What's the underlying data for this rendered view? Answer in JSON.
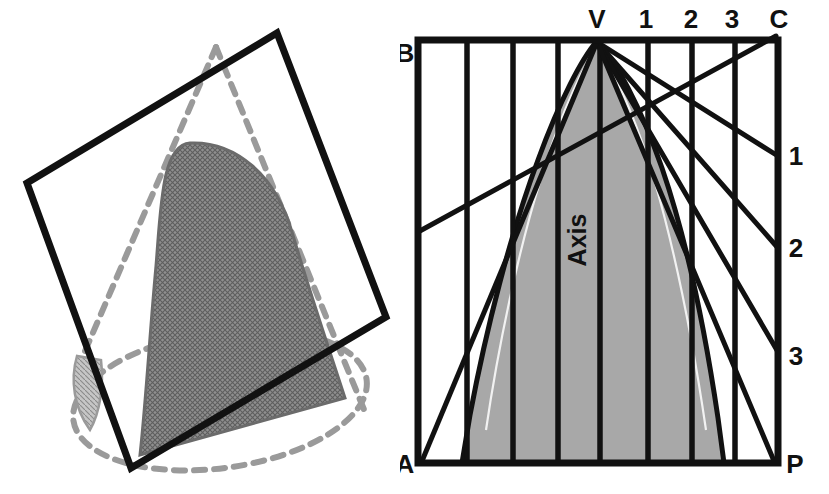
{
  "figure": {
    "panels": [
      {
        "id": "pictorial-view",
        "name": "Pictorial view of cone cut by cutting plane",
        "description": "A dashed cone in pictorial view intersected by a solid-outlined square cutting plane; the resulting parabolic section is shown hatched in grey."
      },
      {
        "id": "orthographic-view",
        "name": "Front view of cone with generator lines and cutting plane trace",
        "description": "Front view of the cone: rectangle A-B-C-P with apex V on the top edge, numbered generator points 1, 2, 3 along the top and right edges, vertical element lines, and the hatched parabolic section."
      }
    ]
  },
  "left_panel": {
    "square": {
      "name": "cutting-plane-square",
      "stroke": "#111111",
      "stroke_width": 7,
      "corners": [
        {
          "x": 27,
          "y": 183
        },
        {
          "x": 277,
          "y": 33
        },
        {
          "x": 386,
          "y": 317
        },
        {
          "x": 131,
          "y": 468
        }
      ]
    },
    "cone": {
      "name": "cone-outline-dashed",
      "stroke": "#9a9a9a",
      "stroke_width": 6,
      "dash": "11 9",
      "apex": {
        "x": 216,
        "y": 47
      },
      "base_ellipse": {
        "cx": 220,
        "cy": 400,
        "rx": 148,
        "ry": 68,
        "rotation": -8
      }
    },
    "section": {
      "name": "parabolic-section-hatched",
      "fill": "#8d8d8d",
      "stroke": "#6d6d6d",
      "stroke_width": 3,
      "hatch_color": "#5d5d5d"
    }
  },
  "right_panel": {
    "rect": {
      "name": "bounding-rectangle",
      "stroke": "#111111",
      "stroke_width": 7,
      "left": 18,
      "right": 378,
      "top": 40,
      "bottom": 463
    },
    "apex": {
      "name": "apex-V",
      "x": 197,
      "y": 40
    },
    "corner_labels": [
      {
        "id": "B",
        "text": "B",
        "x": 4,
        "y": 54,
        "name": "label-B",
        "anchor": "middle"
      },
      {
        "id": "A",
        "text": "A",
        "x": 4,
        "y": 470,
        "name": "label-A",
        "anchor": "middle"
      },
      {
        "id": "P",
        "text": "P",
        "x": 393,
        "y": 470,
        "name": "label-P",
        "anchor": "middle"
      },
      {
        "id": "C",
        "text": "C",
        "x": 378,
        "y": 26,
        "name": "label-C",
        "anchor": "middle"
      }
    ],
    "top_labels": [
      {
        "text": "V",
        "x": 197,
        "y": 26,
        "name": "label-top-V"
      },
      {
        "text": "1",
        "x": 245,
        "y": 26,
        "name": "label-top-1"
      },
      {
        "text": "2",
        "x": 290,
        "y": 26,
        "name": "label-top-2"
      },
      {
        "text": "3",
        "x": 331,
        "y": 26,
        "name": "label-top-3"
      }
    ],
    "side_labels": [
      {
        "text": "1",
        "x": 395,
        "y": 156,
        "name": "label-side-1"
      },
      {
        "text": "2",
        "x": 395,
        "y": 248,
        "name": "label-side-2"
      },
      {
        "text": "3",
        "x": 395,
        "y": 356,
        "name": "label-side-3"
      }
    ],
    "axis_label": {
      "text": "Axis",
      "x": 186,
      "y": 240,
      "rotation": -90,
      "name": "label-axis"
    },
    "element_lines_x": [
      18,
      67,
      113,
      158,
      200,
      248,
      292,
      335,
      378
    ],
    "generator_lines": [
      {
        "name": "generator-V-to-1",
        "from": {
          "x": 197,
          "y": 40
        },
        "to": {
          "x": 378,
          "y": 156
        }
      },
      {
        "name": "generator-V-to-2",
        "from": {
          "x": 197,
          "y": 40
        },
        "to": {
          "x": 378,
          "y": 248
        }
      },
      {
        "name": "generator-V-to-3",
        "from": {
          "x": 197,
          "y": 40
        },
        "to": {
          "x": 378,
          "y": 356
        }
      },
      {
        "name": "generator-V-to-P",
        "from": {
          "x": 197,
          "y": 40
        },
        "to": {
          "x": 378,
          "y": 463
        }
      },
      {
        "name": "generator-V-to-A",
        "from": {
          "x": 197,
          "y": 40
        },
        "to": {
          "x": 18,
          "y": 463
        }
      },
      {
        "name": "cutting-plane-trace",
        "from": {
          "x": 18,
          "y": 230
        },
        "to": {
          "x": 378,
          "y": 35
        }
      }
    ],
    "section": {
      "name": "parabolic-section-front-view",
      "fill": "#a8a8a8",
      "stroke": "#111111",
      "stroke_width": 5
    }
  },
  "colors": {
    "ink": "#111111",
    "section_grey": "#a8a8a8",
    "dash_grey": "#9a9a9a",
    "hatch_grey": "#8d8d8d",
    "background": "#ffffff"
  }
}
